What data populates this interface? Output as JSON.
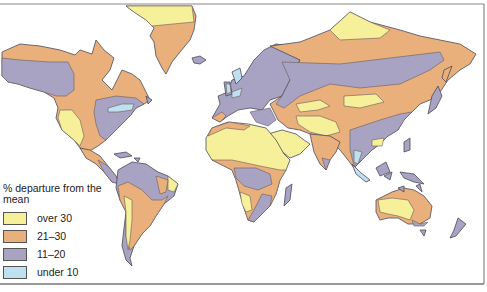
{
  "map": {
    "subject": "World map: percent departure of precipitation from the mean",
    "colors": {
      "ocean": "#ffffff",
      "over_30": "#f6f09a",
      "21_30": "#e9b07c",
      "11_20": "#a8a3c2",
      "under_10": "#bfe0ee",
      "coastline": "#4a4a5a",
      "frame": "#777777"
    }
  },
  "legend": {
    "title": "% departure from the mean",
    "items": [
      {
        "label": "over 30",
        "color": "#f6f09a"
      },
      {
        "label": "21–30",
        "color": "#e9b07c"
      },
      {
        "label": "11–20",
        "color": "#a8a3c2"
      },
      {
        "label": "under 10",
        "color": "#bfe0ee"
      }
    ]
  }
}
